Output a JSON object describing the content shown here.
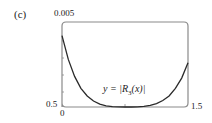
{
  "panel_label": "(c)",
  "axes": {
    "y_top_label": "0.005",
    "y_bottom_label": "0.5",
    "x_left_label": "0",
    "x_right_label": "1.5"
  },
  "curve_label": {
    "prefix": "y = |R",
    "subscript": "3",
    "suffix": "(x)|"
  },
  "chart_data": {
    "type": "line",
    "title": "(c)",
    "xlabel": "",
    "ylabel": "",
    "xlim": [
      0.5,
      1.5
    ],
    "ylim": [
      0,
      0.005
    ],
    "x_tick_labels": [
      "0.5",
      "1.5"
    ],
    "y_tick_labels": [
      "0",
      "0.005"
    ],
    "grid": false,
    "legend": null,
    "annotations": [
      "y = |R3(x)|"
    ],
    "series": [
      {
        "name": "y = |R3(x)|",
        "x": [
          0.5,
          0.55,
          0.6,
          0.65,
          0.7,
          0.75,
          0.8,
          0.85,
          0.9,
          0.95,
          1.0,
          1.05,
          1.1,
          1.15,
          1.2,
          1.25,
          1.3,
          1.35,
          1.4,
          1.45,
          1.5
        ],
        "values": [
          0.0042,
          0.0028,
          0.0018,
          0.0011,
          0.00065,
          0.00035,
          0.00017,
          7e-05,
          2e-05,
          3e-06,
          0.0,
          2e-06,
          1e-05,
          4e-05,
          0.0001,
          0.0002,
          0.00038,
          0.00065,
          0.0011,
          0.0017,
          0.0026
        ]
      }
    ]
  },
  "colors": {
    "axis": "#8a8a8a",
    "curve": "#2a2a2a",
    "text": "#222222"
  }
}
